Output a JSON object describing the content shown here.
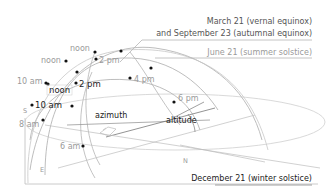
{
  "diagram": {
    "legend": {
      "equinox_line1": "March 21 (vernal equinox)",
      "equinox_line2": "and September 23 (autumnal equinox)",
      "summer": "June 21 (summer solstice)",
      "winter": "December 21 (winter solstice)"
    },
    "summer_path": {
      "noon": "noon",
      "two_pm": "2 pm",
      "four_pm": "4 pm",
      "six_pm": "6 pm"
    },
    "equinox_path": {
      "noon": "noon",
      "ten_am": "10 am",
      "two_pm": "2 pm",
      "eight_am": "8 am",
      "six_am": "6 am"
    },
    "winter_path": {
      "noon": "noon",
      "ten_am": "10 am",
      "two_pm": "2 pm"
    },
    "angles": {
      "azimuth": "azimuth",
      "altitude": "altitude"
    },
    "compass": {
      "north": "N",
      "east": "E",
      "south": "S"
    },
    "colors": {
      "line": "#b5b5b5",
      "dark_text": "#222222",
      "light_text": "#9a9a9a",
      "dot": "#111111"
    }
  }
}
